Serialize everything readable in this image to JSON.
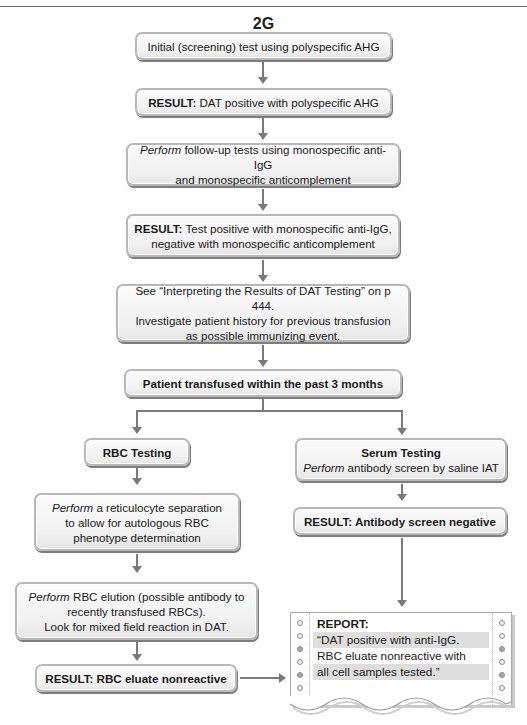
{
  "figure": {
    "label": "2G"
  },
  "header": {
    "tick_mark": "(a)"
  },
  "flow": {
    "step1": {
      "text": "Initial (screening) test using polyspecific AHG"
    },
    "step2": {
      "prefix": "RESULT:",
      "text": " DAT positive with polyspecific AHG"
    },
    "step3": {
      "prefix": "Perform",
      "line1": " follow-up tests using monospecific anti-IgG",
      "line2": "and monospecific anticomplement"
    },
    "step4": {
      "prefix": "RESULT:",
      "line1": " Test positive with monospecific anti-IgG,",
      "line2": "negative with monospecific anticomplement"
    },
    "step5": {
      "line1": "See “Interpreting the Results of DAT Testing” on p 444.",
      "line2": "Investigate patient history for previous transfusion",
      "line3": "as possible immunizing event."
    },
    "step6": {
      "text": "Patient transfused within the past 3 months"
    },
    "left": {
      "rbc_testing": {
        "text": "RBC Testing"
      },
      "reticulocyte": {
        "prefix": "Perform",
        "line1": " a reticulocyte separation",
        "line2": "to allow for autologous RBC",
        "line3": "phenotype determination"
      },
      "elution": {
        "prefix": "Perform",
        "line1": " RBC elution (possible antibody to",
        "line2": "recently transfused RBCs).",
        "line3": "Look for mixed field reaction in DAT."
      },
      "result": {
        "prefix": "RESULT:",
        "text": " RBC eluate nonreactive"
      }
    },
    "right": {
      "serum_testing": {
        "title": "Serum Testing",
        "prefix": "Perform",
        "text": " antibody screen by saline IAT"
      },
      "result": {
        "prefix": "RESULT:",
        "text": " Antibody screen negative"
      }
    }
  },
  "report": {
    "title": "REPORT:",
    "lines": [
      "“DAT positive with anti-IgG.",
      "RBC eluate nonreactive with",
      "all cell samples tested.”"
    ]
  },
  "colors": {
    "box_fill": "#f1f1f1",
    "box_border": "#b8b8b8",
    "connector": "#7a7a7a",
    "report_shade": "#dedede"
  }
}
